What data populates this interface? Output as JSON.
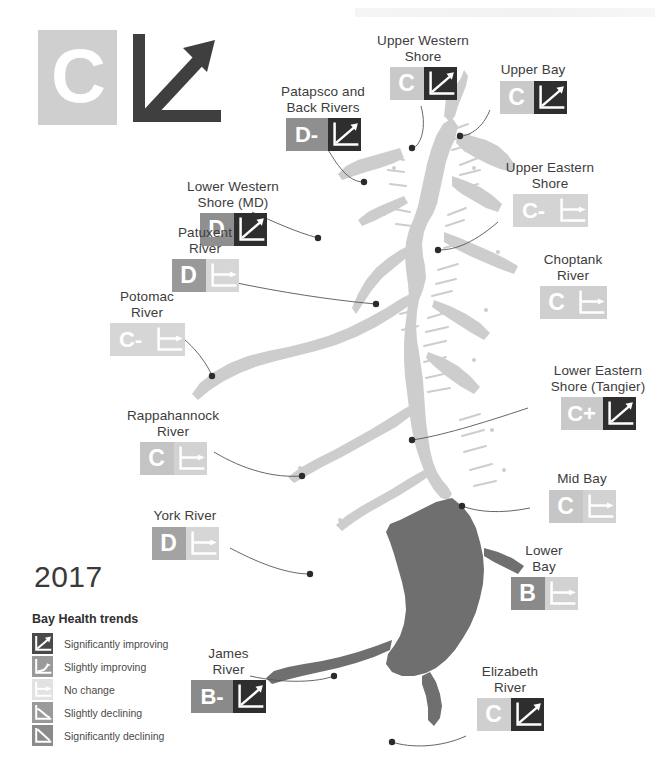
{
  "year": "2017",
  "logo": {
    "grade": "C",
    "trend_icon": "significantly-improving-arrow",
    "grade_bg": "#cfcfcf",
    "trend_color": "#3f3f3f"
  },
  "legend": {
    "title": "Bay Health trends",
    "items": [
      {
        "label": "Significantly improving",
        "icon": "trend-strong-up-icon",
        "color": "#4a4a4a"
      },
      {
        "label": "Slightly improving",
        "icon": "trend-slight-up-icon",
        "color": "#9a9a9a"
      },
      {
        "label": "No change",
        "icon": "trend-flat-icon",
        "color": "#e2e2e2"
      },
      {
        "label": "Slightly declining",
        "icon": "trend-slight-down-icon",
        "color": "#9a9a9a"
      },
      {
        "label": "Significantly declining",
        "icon": "trend-strong-down-icon",
        "color": "#8a8a8a"
      }
    ]
  },
  "regions": [
    {
      "id": "upper-western-shore",
      "name": "Upper Western\nShore",
      "grade": "C",
      "grade_bg": "#c9c9c9",
      "trend": "Significantly improving",
      "trend_icon": "trend-strong-up-icon",
      "trend_bg": "#2e2e2e",
      "label_x": 363,
      "label_y": 33,
      "label_w": 120,
      "badge_w": 34,
      "badge_h": 33,
      "grade_font": 23
    },
    {
      "id": "upper-bay",
      "name": "Upper Bay",
      "grade": "C",
      "grade_bg": "#c9c9c9",
      "trend": "Significantly improving",
      "trend_icon": "trend-strong-up-icon",
      "trend_bg": "#2e2e2e",
      "label_x": 478,
      "label_y": 62,
      "label_w": 110,
      "badge_w": 34,
      "badge_h": 33,
      "grade_font": 23
    },
    {
      "id": "patapsco-and-back-rivers",
      "name": "Patapsco and\nBack Rivers",
      "grade": "D-",
      "grade_bg": "#8f8f8f",
      "trend": "Significantly improving",
      "trend_icon": "trend-strong-up-icon",
      "trend_bg": "#2e2e2e",
      "label_x": 263,
      "label_y": 84,
      "label_w": 120,
      "badge_w": 42,
      "badge_h": 33,
      "grade_font": 22
    },
    {
      "id": "upper-eastern-shore",
      "name": "Upper Eastern\nShore",
      "grade": "C-",
      "grade_bg": "#d4d4d4",
      "trend": "No change",
      "trend_icon": "trend-flat-icon",
      "trend_bg": "#d4d4d4",
      "label_x": 485,
      "label_y": 160,
      "label_w": 130,
      "badge_w": 42,
      "badge_h": 33,
      "grade_font": 22
    },
    {
      "id": "lower-western-shore-md",
      "name": "Lower Western\nShore (MD)",
      "grade": "D",
      "grade_bg": "#8f8f8f",
      "trend": "Significantly improving",
      "trend_icon": "trend-strong-up-icon",
      "trend_bg": "#2e2e2e",
      "label_x": 168,
      "label_y": 179,
      "label_w": 130,
      "badge_w": 34,
      "badge_h": 33,
      "grade_font": 23
    },
    {
      "id": "patuxent-river",
      "name": "Patuxent\nRiver",
      "grade": "D",
      "grade_bg": "#999999",
      "trend": "No change",
      "trend_icon": "trend-flat-icon",
      "trend_bg": "#d6d6d6",
      "label_x": 150,
      "label_y": 225,
      "label_w": 110,
      "badge_w": 34,
      "badge_h": 33,
      "grade_font": 23
    },
    {
      "id": "choptank-river",
      "name": "Choptank\nRiver",
      "grade": "C",
      "grade_bg": "#cfcfcf",
      "trend": "No change",
      "trend_icon": "trend-flat-icon",
      "trend_bg": "#cfcfcf",
      "label_x": 518,
      "label_y": 252,
      "label_w": 110,
      "badge_w": 34,
      "badge_h": 33,
      "grade_font": 23
    },
    {
      "id": "potomac-river",
      "name": "Potomac\nRiver",
      "grade": "C-",
      "grade_bg": "#d6d6d6",
      "trend": "No change",
      "trend_icon": "trend-flat-icon",
      "trend_bg": "#d6d6d6",
      "label_x": 92,
      "label_y": 289,
      "label_w": 110,
      "badge_w": 42,
      "badge_h": 33,
      "grade_font": 22
    },
    {
      "id": "lower-eastern-shore-tangier",
      "name": "Lower Eastern\nShore (Tangier)",
      "grade": "C+",
      "grade_bg": "#c9c9c9",
      "trend": "Significantly improving",
      "trend_icon": "trend-strong-up-icon",
      "trend_bg": "#2e2e2e",
      "label_x": 528,
      "label_y": 363,
      "label_w": 140,
      "badge_w": 42,
      "badge_h": 33,
      "grade_font": 22
    },
    {
      "id": "rappahannock-river",
      "name": "Rappahannock\nRiver",
      "grade": "C",
      "grade_bg": "#c4c4c4",
      "trend": "No change",
      "trend_icon": "trend-flat-icon",
      "trend_bg": "#d2d2d2",
      "label_x": 108,
      "label_y": 408,
      "label_w": 130,
      "badge_w": 34,
      "badge_h": 33,
      "grade_font": 23
    },
    {
      "id": "mid-bay",
      "name": "Mid Bay",
      "grade": "C",
      "grade_bg": "#c6c6c6",
      "trend": "No change",
      "trend_icon": "trend-flat-icon",
      "trend_bg": "#d2d2d2",
      "label_x": 527,
      "label_y": 471,
      "label_w": 110,
      "badge_w": 34,
      "badge_h": 33,
      "grade_font": 23
    },
    {
      "id": "york-river",
      "name": "York River",
      "grade": "D",
      "grade_bg": "#a3a3a3",
      "trend": "No change",
      "trend_icon": "trend-flat-icon",
      "trend_bg": "#d6d6d6",
      "label_x": 130,
      "label_y": 508,
      "label_w": 110,
      "badge_w": 34,
      "badge_h": 33,
      "grade_font": 23
    },
    {
      "id": "lower-bay",
      "name": "Lower\nBay",
      "grade": "B",
      "grade_bg": "#8a8a8a",
      "trend": "No change",
      "trend_icon": "trend-flat-icon",
      "trend_bg": "#d2d2d2",
      "label_x": 494,
      "label_y": 543,
      "label_w": 100,
      "badge_w": 34,
      "badge_h": 33,
      "grade_font": 23
    },
    {
      "id": "james-river",
      "name": "James\nRiver",
      "grade": "B-",
      "grade_bg": "#8a8a8a",
      "trend": "Significantly improving",
      "trend_icon": "trend-strong-up-icon",
      "trend_bg": "#2e2e2e",
      "label_x": 176,
      "label_y": 646,
      "label_w": 105,
      "badge_w": 42,
      "badge_h": 33,
      "grade_font": 22
    },
    {
      "id": "elizabeth-river",
      "name": "Elizabeth\nRiver",
      "grade": "C",
      "grade_bg": "#cfcfcf",
      "trend": "Significantly improving",
      "trend_icon": "trend-strong-up-icon",
      "trend_bg": "#2e2e2e",
      "label_x": 455,
      "label_y": 664,
      "label_w": 110,
      "badge_w": 34,
      "badge_h": 33,
      "grade_font": 23
    }
  ],
  "map": {
    "water_light": "#cdcdcd",
    "water_dark": "#6f6f6f",
    "land": "#ffffff",
    "leader_color": "#55555a"
  }
}
